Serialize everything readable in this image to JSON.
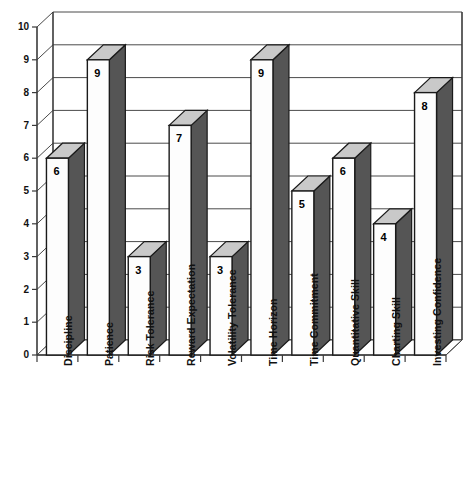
{
  "chart_data": {
    "type": "bar",
    "title": "",
    "subtitle": "",
    "xlabel": "",
    "ylabel": "",
    "ylim": [
      0,
      10
    ],
    "ytick_values": [
      0,
      1,
      2,
      3,
      4,
      5,
      6,
      7,
      8,
      9,
      10
    ],
    "grid": true,
    "legend": false,
    "legend_position": "none",
    "style": "3d-column",
    "categories": [
      "Discipline",
      "Patience",
      "Risk Tolerance",
      "Reward Expectation",
      "Volatility Tolerance",
      "Time Horizon",
      "Time Commitment",
      "Quantitative Skill",
      "Charting Skill",
      "Investing Confidence"
    ],
    "values": [
      6,
      9,
      3,
      7,
      3,
      9,
      5,
      6,
      4,
      8
    ],
    "data_labels": [
      "6",
      "9",
      "3",
      "7",
      "3",
      "9",
      "5",
      "6",
      "4",
      "8"
    ],
    "colors": {
      "bar_front": "#fdfdfd",
      "bar_side": "#555555",
      "bar_top": "#c9c9c9",
      "axis": "#3a3a3a",
      "grid": "#4a4a4a",
      "text": "#111111",
      "background": "#ffffff"
    }
  }
}
